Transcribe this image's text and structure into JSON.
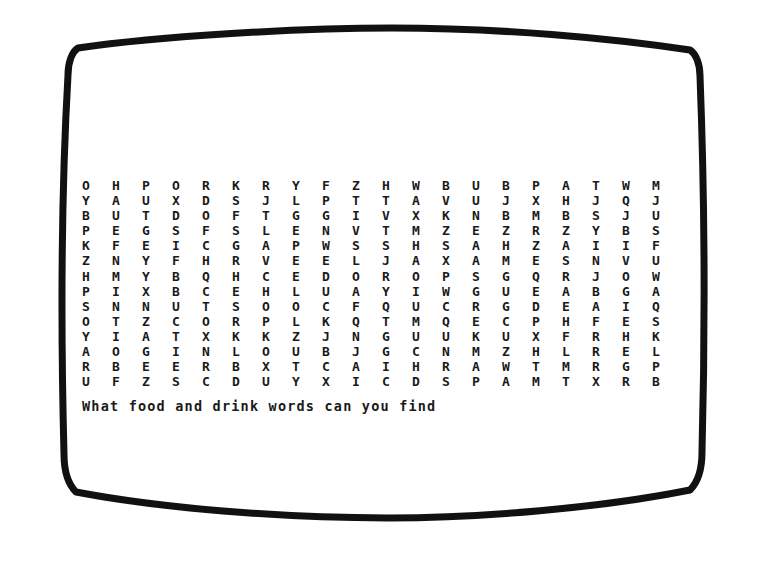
{
  "screen": {
    "type": "crt-television-screen",
    "frame_color": "#111111",
    "background_color": "#ffffff",
    "text_color": "#1a1a1a"
  },
  "puzzle": {
    "kind": "word-search",
    "columns": 20,
    "rows": 16,
    "grid": [
      [
        "O",
        "H",
        "P",
        "O",
        "R",
        "K",
        "R",
        "Y",
        "F",
        "Z",
        "H",
        "W",
        "B",
        "U",
        "B",
        "P",
        "A",
        "T",
        "W",
        "M"
      ],
      [
        "Y",
        "A",
        "U",
        "X",
        "D",
        "S",
        "J",
        "L",
        "P",
        "T",
        "T",
        "A",
        "V",
        "U",
        "J",
        "X",
        "H",
        "J",
        "Q",
        "J"
      ],
      [
        "B",
        "U",
        "T",
        "D",
        "O",
        "F",
        "T",
        "G",
        "G",
        "I",
        "V",
        "X",
        "K",
        "N",
        "B",
        "M",
        "B",
        "S",
        "J",
        "U"
      ],
      [
        "P",
        "E",
        "G",
        "S",
        "F",
        "S",
        "L",
        "E",
        "N",
        "V",
        "T",
        "M",
        "Z",
        "E",
        "Z",
        "R",
        "Z",
        "Y",
        "B",
        "S"
      ],
      [
        "K",
        "F",
        "E",
        "I",
        "C",
        "G",
        "A",
        "P",
        "W",
        "S",
        "S",
        "H",
        "S",
        "A",
        "H",
        "Z",
        "A",
        "I",
        "I",
        "F"
      ],
      [
        "Z",
        "N",
        "Y",
        "F",
        "H",
        "R",
        "V",
        "E",
        "E",
        "L",
        "J",
        "A",
        "X",
        "A",
        "M",
        "E",
        "S",
        "N",
        "V",
        "U"
      ],
      [
        "H",
        "M",
        "Y",
        "B",
        "Q",
        "H",
        "C",
        "E",
        "D",
        "O",
        "R",
        "O",
        "P",
        "S",
        "G",
        "Q",
        "R",
        "J",
        "O",
        "W"
      ],
      [
        "P",
        "I",
        "X",
        "B",
        "C",
        "E",
        "H",
        "L",
        "U",
        "A",
        "Y",
        "I",
        "W",
        "G",
        "U",
        "E",
        "A",
        "B",
        "G",
        "A"
      ],
      [
        "S",
        "N",
        "N",
        "U",
        "T",
        "S",
        "O",
        "O",
        "C",
        "F",
        "Q",
        "U",
        "C",
        "R",
        "G",
        "D",
        "E",
        "A",
        "I",
        "Q"
      ],
      [
        "O",
        "T",
        "Z",
        "C",
        "O",
        "R",
        "P",
        "L",
        "K",
        "Q",
        "T",
        "M",
        "Q",
        "E",
        "C",
        "P",
        "H",
        "F",
        "E",
        "S"
      ],
      [
        "Y",
        "I",
        "A",
        "T",
        "X",
        "K",
        "K",
        "Z",
        "J",
        "N",
        "G",
        "U",
        "U",
        "K",
        "U",
        "X",
        "F",
        "R",
        "H",
        "K"
      ],
      [
        "A",
        "O",
        "G",
        "I",
        "N",
        "L",
        "O",
        "U",
        "B",
        "J",
        "G",
        "C",
        "N",
        "M",
        "Z",
        "H",
        "L",
        "R",
        "E",
        "L"
      ],
      [
        "R",
        "B",
        "E",
        "E",
        "R",
        "B",
        "X",
        "T",
        "C",
        "A",
        "I",
        "H",
        "R",
        "A",
        "W",
        "T",
        "M",
        "R",
        "G",
        "P"
      ],
      [
        "U",
        "F",
        "Z",
        "S",
        "C",
        "D",
        "U",
        "Y",
        "X",
        "I",
        "C",
        "D",
        "S",
        "P",
        "A",
        "M",
        "T",
        "X",
        "R",
        "B"
      ]
    ],
    "caption": "What food and drink words can you find"
  }
}
